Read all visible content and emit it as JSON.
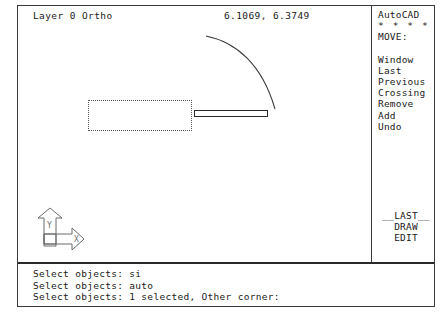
{
  "app": {
    "name": "AutoCAD",
    "screen_bg": "#ffffff",
    "ink": "#1a1a1a"
  },
  "header": {
    "status_left": "Layer 0 Ortho",
    "coordinates": "6.1069, 6.3749"
  },
  "side_menu": {
    "title": "AutoCAD",
    "stars": "* * * *",
    "active_command": "MOVE:",
    "items": [
      {
        "label": "Window"
      },
      {
        "label": "Last"
      },
      {
        "label": "Previous"
      },
      {
        "label": "Crossing"
      },
      {
        "label": "Remove"
      },
      {
        "label": "Add"
      },
      {
        "label": "Undo"
      }
    ],
    "bottom_items": [
      {
        "label": "__LAST__"
      },
      {
        "label": "DRAW"
      },
      {
        "label": "EDIT"
      }
    ]
  },
  "drawing": {
    "ucs_icon": {
      "x_label": "X",
      "y_label": "Y",
      "origin_label": "W"
    },
    "entities": [
      {
        "name": "selection-rectangle",
        "type": "rectangle",
        "style": "dotted"
      },
      {
        "name": "thin-bar-rectangle",
        "type": "rectangle",
        "style": "solid"
      },
      {
        "name": "arc",
        "type": "arc",
        "style": "solid"
      }
    ]
  },
  "command_area": {
    "lines": [
      "Select objects: si",
      "Select objects: auto",
      "Select objects: 1 selected, Other corner:"
    ]
  }
}
